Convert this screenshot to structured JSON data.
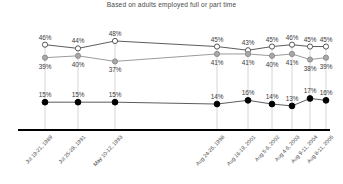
{
  "chart_data": {
    "type": "line",
    "title": "Based on adults employed full or part time",
    "xlabel": "",
    "ylabel": "",
    "ylim": [
      0,
      55
    ],
    "grid": "vertical-droplines",
    "legend": "none",
    "categories": [
      "Jul 19-21, 1989",
      "Jul 25-28, 1991",
      "May 10-12, 1993",
      "Aug 24-26, 1998",
      "Aug 16-19, 2001",
      "Aug 5-6, 2002",
      "Aug 4-6, 2003",
      "Aug 9-11, 2004",
      "Aug 8-11, 2005"
    ],
    "x_positions": [
      45,
      78,
      115,
      217,
      248,
      272,
      292,
      310,
      326
    ],
    "series": [
      {
        "name": "open-circle-series",
        "marker": "open-circle",
        "color": "#555555",
        "values": [
          46,
          44,
          48,
          45,
          43,
          45,
          46,
          45,
          45
        ],
        "labels": [
          "46%",
          "44%",
          "48%",
          "45%",
          "43%",
          "45%",
          "46%",
          "45%",
          "45%"
        ],
        "label_positions": [
          "above",
          "above",
          "above",
          "above",
          "above",
          "above",
          "above",
          "above",
          "above"
        ]
      },
      {
        "name": "gray-circle-series",
        "marker": "gray-filled-circle",
        "color": "#9a9a9a",
        "values": [
          39,
          40,
          37,
          41,
          41,
          40,
          41,
          38,
          39
        ],
        "labels": [
          "39%",
          "40%",
          "37%",
          "41%",
          "41%",
          "40%",
          "41%",
          "38%",
          "39%"
        ],
        "label_positions": [
          "below",
          "below",
          "below",
          "below",
          "below",
          "below",
          "below",
          "below",
          "below"
        ]
      },
      {
        "name": "black-circle-series",
        "marker": "black-filled-circle",
        "color": "#111111",
        "values": [
          15,
          15,
          15,
          14,
          16,
          14,
          13,
          17,
          16
        ],
        "labels": [
          "15%",
          "15%",
          "15%",
          "14%",
          "16%",
          "14%",
          "13%",
          "17%",
          "16%"
        ],
        "label_positions": [
          "above",
          "above",
          "above",
          "above",
          "above",
          "above",
          "above",
          "above",
          "above"
        ]
      }
    ],
    "axis": {
      "baseline_color": "#000000",
      "dropline_color": "#cccccc"
    }
  }
}
